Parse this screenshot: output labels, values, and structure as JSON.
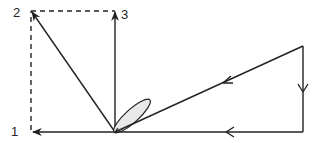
{
  "diagram": {
    "type": "vector-diagram",
    "labels": [
      {
        "id": "1",
        "text": "1"
      },
      {
        "id": "2",
        "text": "2"
      },
      {
        "id": "3",
        "text": "3"
      }
    ],
    "colors": {
      "line": "#222222",
      "lobe_fill": "#e8e8e8",
      "background": "#ffffff"
    },
    "elements": [
      "solid arrow from origin to point 1 (left, horizontal)",
      "solid arrow from origin to point 2 (upper-left)",
      "solid arrow from origin to point 3 (vertical up)",
      "dashed line from point 1 up to point 2",
      "dashed line from point 2 right to point 3",
      "closed triangular loop on right with direction arrows (up-right corner, down right side, left along bottom, back toward origin)",
      "elliptical lobe near origin pointing upper-right"
    ]
  }
}
